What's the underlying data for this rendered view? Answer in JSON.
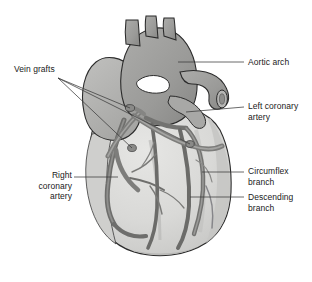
{
  "figure": {
    "type": "anatomical-illustration",
    "background_color": "#ffffff",
    "width": 312,
    "height": 282,
    "palette": {
      "background": "#ffffff",
      "ventricle_fill": "#d8d8d6",
      "ventricle_shadow": "#c2c2c0",
      "atrium_fill": "#b4b4b2",
      "aorta_fill": "#9a9a98",
      "aorta_dark": "#86868a",
      "vessel_gray": "#787876",
      "vessel_dark": "#5e5e5c",
      "outline": "#2b2b2b",
      "leader_line": "#3a3a3a",
      "label_text": "#1a1a1a"
    }
  },
  "labels": {
    "vein_grafts": "Vein grafts",
    "right_coronary_artery": "Right\ncoronary\nartery",
    "aortic_arch": "Aortic arch",
    "left_coronary_artery": "Left coronary\nartery",
    "circumflex_branch": "Circumflex\nbranch",
    "descending_branch": "Descending\nbranch"
  },
  "annotations": [
    {
      "id": "vein-grafts",
      "label": "Vein grafts",
      "side": "left",
      "leader_count": 3
    },
    {
      "id": "right-coronary-artery",
      "label": "Right coronary artery",
      "side": "left",
      "leader_count": 1
    },
    {
      "id": "aortic-arch",
      "label": "Aortic arch",
      "side": "right",
      "leader_count": 1
    },
    {
      "id": "left-coronary-artery",
      "label": "Left coronary artery",
      "side": "right",
      "leader_count": 1
    },
    {
      "id": "circumflex-branch",
      "label": "Circumflex branch",
      "side": "right",
      "leader_count": 1
    },
    {
      "id": "descending-branch",
      "label": "Descending branch",
      "side": "right",
      "leader_count": 1
    }
  ],
  "structures": [
    {
      "id": "great-vessels",
      "name": "Great vessels (brachiocephalic, left common carotid, left subclavian)"
    },
    {
      "id": "aortic-arch",
      "name": "Aortic arch"
    },
    {
      "id": "aorta-cut-end",
      "name": "Cut end of descending aorta"
    },
    {
      "id": "pulmonary-artery",
      "name": "Pulmonary artery"
    },
    {
      "id": "left-ventricle",
      "name": "Left ventricle"
    },
    {
      "id": "right-ventricle",
      "name": "Right ventricle"
    },
    {
      "id": "heart-apex",
      "name": "Apex of heart"
    }
  ]
}
